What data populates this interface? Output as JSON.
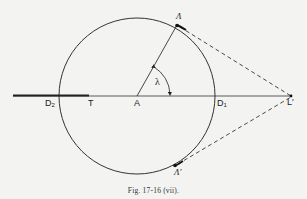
{
  "figure": {
    "caption": "Fig. 17-16 (vii).",
    "colors": {
      "background": "#f3f3f1",
      "ink": "#222222"
    }
  },
  "labels": {
    "lambda_point": "Λ",
    "lambda_prime_point": "Λ′",
    "center": "A",
    "tangent_point": "T",
    "d1_base": "D",
    "d1_sub": "1",
    "d2_base": "D",
    "d2_sub": "2",
    "l_prime": "L′",
    "angle": "λ"
  }
}
